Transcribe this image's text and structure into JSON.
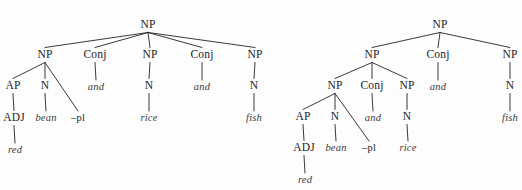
{
  "figure": {
    "type": "syntax-tree-pair",
    "canvas": {
      "width": 522,
      "height": 190,
      "background": "#fdfdfd",
      "ink": "#23232a"
    }
  },
  "trees": [
    {
      "id": "tree-left",
      "name": "flat-coordination-tree",
      "nodes": [
        {
          "id": "L-root",
          "label": "NP",
          "kind": "cat",
          "x": 148,
          "y": 25
        },
        {
          "id": "L-np1",
          "label": "NP",
          "kind": "cat",
          "x": 45,
          "y": 55
        },
        {
          "id": "L-conj1",
          "label": "Conj",
          "kind": "cat",
          "x": 95,
          "y": 55
        },
        {
          "id": "L-np2",
          "label": "NP",
          "kind": "cat",
          "x": 150,
          "y": 55
        },
        {
          "id": "L-conj2",
          "label": "Conj",
          "kind": "cat",
          "x": 202,
          "y": 55
        },
        {
          "id": "L-np3",
          "label": "NP",
          "kind": "cat",
          "x": 255,
          "y": 55
        },
        {
          "id": "L-ap",
          "label": "AP",
          "kind": "cat",
          "x": 13,
          "y": 86
        },
        {
          "id": "L-n1",
          "label": "N",
          "kind": "cat",
          "x": 45,
          "y": 86
        },
        {
          "id": "L-and1",
          "label": "and",
          "kind": "word",
          "x": 96,
          "y": 87
        },
        {
          "id": "L-n2",
          "label": "N",
          "kind": "cat",
          "x": 149,
          "y": 86
        },
        {
          "id": "L-and2",
          "label": "and",
          "kind": "word",
          "x": 202,
          "y": 87
        },
        {
          "id": "L-n3",
          "label": "N",
          "kind": "cat",
          "x": 254,
          "y": 86
        },
        {
          "id": "L-adj",
          "label": "ADJ",
          "kind": "cat",
          "x": 14,
          "y": 118
        },
        {
          "id": "L-bean",
          "label": "bean",
          "kind": "word",
          "x": 46,
          "y": 118
        },
        {
          "id": "L-pl",
          "label": "–pl",
          "kind": "morph",
          "x": 78,
          "y": 118
        },
        {
          "id": "L-rice",
          "label": "rice",
          "kind": "word",
          "x": 149,
          "y": 118
        },
        {
          "id": "L-fish",
          "label": "fish",
          "kind": "word",
          "x": 254,
          "y": 118
        },
        {
          "id": "L-red",
          "label": "red",
          "kind": "word",
          "x": 15,
          "y": 150
        }
      ],
      "edges": [
        {
          "from": "L-root",
          "to": "L-np1"
        },
        {
          "from": "L-root",
          "to": "L-conj1"
        },
        {
          "from": "L-root",
          "to": "L-np2"
        },
        {
          "from": "L-root",
          "to": "L-conj2"
        },
        {
          "from": "L-root",
          "to": "L-np3"
        },
        {
          "from": "L-np1",
          "to": "L-ap"
        },
        {
          "from": "L-np1",
          "to": "L-n1"
        },
        {
          "from": "L-np1",
          "to": "L-pl"
        },
        {
          "from": "L-conj1",
          "to": "L-and1"
        },
        {
          "from": "L-np2",
          "to": "L-n2"
        },
        {
          "from": "L-conj2",
          "to": "L-and2"
        },
        {
          "from": "L-np3",
          "to": "L-n3"
        },
        {
          "from": "L-ap",
          "to": "L-adj"
        },
        {
          "from": "L-n1",
          "to": "L-bean"
        },
        {
          "from": "L-n2",
          "to": "L-rice"
        },
        {
          "from": "L-n3",
          "to": "L-fish"
        },
        {
          "from": "L-adj",
          "to": "L-red"
        }
      ]
    },
    {
      "id": "tree-right",
      "name": "nested-coordination-tree",
      "nodes": [
        {
          "id": "R-root",
          "label": "NP",
          "kind": "cat",
          "x": 440,
          "y": 25
        },
        {
          "id": "R-np-a",
          "label": "NP",
          "kind": "cat",
          "x": 372,
          "y": 55
        },
        {
          "id": "R-conj-a",
          "label": "Conj",
          "kind": "cat",
          "x": 438,
          "y": 55
        },
        {
          "id": "R-np-b",
          "label": "NP",
          "kind": "cat",
          "x": 510,
          "y": 55
        },
        {
          "id": "R-np1",
          "label": "NP",
          "kind": "cat",
          "x": 335,
          "y": 86
        },
        {
          "id": "R-conj1",
          "label": "Conj",
          "kind": "cat",
          "x": 372,
          "y": 86
        },
        {
          "id": "R-np2",
          "label": "NP",
          "kind": "cat",
          "x": 407,
          "y": 86
        },
        {
          "id": "R-and-a",
          "label": "and",
          "kind": "word",
          "x": 438,
          "y": 87
        },
        {
          "id": "R-n3",
          "label": "N",
          "kind": "cat",
          "x": 510,
          "y": 86
        },
        {
          "id": "R-ap",
          "label": "AP",
          "kind": "cat",
          "x": 303,
          "y": 117
        },
        {
          "id": "R-n1",
          "label": "N",
          "kind": "cat",
          "x": 335,
          "y": 117
        },
        {
          "id": "R-and1",
          "label": "and",
          "kind": "word",
          "x": 373,
          "y": 118
        },
        {
          "id": "R-n2",
          "label": "N",
          "kind": "cat",
          "x": 407,
          "y": 117
        },
        {
          "id": "R-fish",
          "label": "fish",
          "kind": "word",
          "x": 510,
          "y": 118
        },
        {
          "id": "R-adj",
          "label": "ADJ",
          "kind": "cat",
          "x": 304,
          "y": 148
        },
        {
          "id": "R-bean",
          "label": "bean",
          "kind": "word",
          "x": 336,
          "y": 148
        },
        {
          "id": "R-pl",
          "label": "–pl",
          "kind": "morph",
          "x": 369,
          "y": 148
        },
        {
          "id": "R-rice",
          "label": "rice",
          "kind": "word",
          "x": 408,
          "y": 148
        },
        {
          "id": "R-red",
          "label": "red",
          "kind": "word",
          "x": 305,
          "y": 180
        }
      ],
      "edges": [
        {
          "from": "R-root",
          "to": "R-np-a"
        },
        {
          "from": "R-root",
          "to": "R-conj-a"
        },
        {
          "from": "R-root",
          "to": "R-np-b"
        },
        {
          "from": "R-np-a",
          "to": "R-np1"
        },
        {
          "from": "R-np-a",
          "to": "R-conj1"
        },
        {
          "from": "R-np-a",
          "to": "R-np2"
        },
        {
          "from": "R-conj-a",
          "to": "R-and-a"
        },
        {
          "from": "R-np-b",
          "to": "R-n3"
        },
        {
          "from": "R-np1",
          "to": "R-ap"
        },
        {
          "from": "R-np1",
          "to": "R-n1"
        },
        {
          "from": "R-np1",
          "to": "R-pl"
        },
        {
          "from": "R-conj1",
          "to": "R-and1"
        },
        {
          "from": "R-np2",
          "to": "R-n2"
        },
        {
          "from": "R-n3",
          "to": "R-fish"
        },
        {
          "from": "R-ap",
          "to": "R-adj"
        },
        {
          "from": "R-n1",
          "to": "R-bean"
        },
        {
          "from": "R-n2",
          "to": "R-rice"
        },
        {
          "from": "R-adj",
          "to": "R-red"
        }
      ]
    }
  ]
}
